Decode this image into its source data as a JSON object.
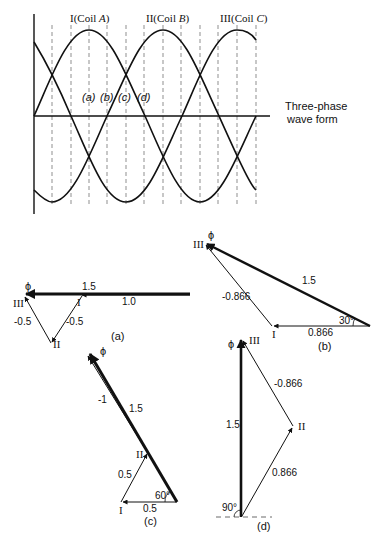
{
  "waveform": {
    "title": "Three-phase wave form",
    "title_line1": "Three-phase",
    "title_line2": "wave form",
    "coil_labels": [
      {
        "roman": "I",
        "text": "(Coil ",
        "letter": "A",
        "close": ")"
      },
      {
        "roman": "II",
        "text": "(Coil ",
        "letter": "B",
        "close": ")"
      },
      {
        "roman": "III",
        "text": "(Coil ",
        "letter": "C",
        "close": ")"
      }
    ],
    "instant_labels": [
      "(a)",
      "(b)",
      "(c)",
      "(d)"
    ]
  },
  "phasor_a": {
    "caption": "(a)",
    "flux_symbol": "ϕ",
    "resultant_label": "1.5",
    "coil_I_value": "1.0",
    "coil_II_value": "-0.5",
    "coil_III_value": "-0.5",
    "vertex_labels": {
      "I": "I",
      "II": "II",
      "III": "III"
    }
  },
  "phasor_b": {
    "caption": "(b)",
    "flux_symbol": "ϕ",
    "resultant_label": "1.5",
    "coil_I_value": "0.866",
    "coil_III_value": "-0.866",
    "angle": "30°",
    "vertex_labels": {
      "I": "I",
      "III": "III"
    }
  },
  "phasor_c": {
    "caption": "(c)",
    "flux_symbol": "ϕ",
    "resultant_label": "1.5",
    "coil_III_value": "-1",
    "coil_II_value": "0.5",
    "coil_I_value": "0.5",
    "angle": "60°",
    "vertex_labels": {
      "I": "I",
      "II": "II"
    }
  },
  "phasor_d": {
    "caption": "(d)",
    "flux_symbol": "ϕ",
    "resultant_label": "1.5",
    "coil_III_value": "-0.866",
    "coil_II_value": "0.866",
    "angle": "90°",
    "vertex_labels": {
      "II": "II",
      "III": "III"
    }
  }
}
